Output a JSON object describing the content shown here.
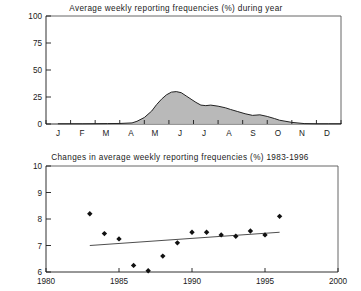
{
  "figure": {
    "width": 361,
    "height": 291,
    "background": "#ffffff",
    "ink_color": "#1a1a1a",
    "area_fill_color": "#b5b5b5",
    "area_line_color": "#222222",
    "marker_color": "#111111",
    "trend_color": "#3a3a3a"
  },
  "chart_data": [
    {
      "type": "area",
      "title": "Average weekly reporting frequencies (%) during year",
      "xlabel": "",
      "ylabel": "",
      "ylim": [
        0,
        100
      ],
      "yticks": [
        0,
        25,
        50,
        75,
        100
      ],
      "ytick_labels": [
        "0",
        "25",
        "50",
        "75",
        "100"
      ],
      "categories": [
        "J",
        "F",
        "M",
        "A",
        "M",
        "J",
        "J",
        "A",
        "S",
        "O",
        "N",
        "D"
      ],
      "xtick_labels": [
        "J",
        "F",
        "M",
        "A",
        "M",
        "J",
        "J",
        "A",
        "S",
        "O",
        "N",
        "D"
      ],
      "grid": false,
      "legend": "none",
      "x": [
        0.0,
        0.5,
        1.0,
        1.5,
        2.0,
        2.5,
        3.0,
        3.2,
        3.5,
        3.8,
        4.0,
        4.2,
        4.4,
        4.6,
        4.8,
        5.0,
        5.2,
        5.4,
        5.6,
        5.8,
        6.0,
        6.2,
        6.5,
        6.8,
        7.0,
        7.3,
        7.6,
        7.9,
        8.2,
        8.5,
        8.8,
        9.0,
        9.5,
        10.0,
        10.5,
        11.0,
        11.5
      ],
      "values": [
        0.2,
        0.2,
        0.2,
        0.3,
        0.4,
        0.5,
        1.0,
        2.5,
        6.0,
        12.0,
        18.0,
        23.0,
        27.0,
        29.5,
        30.0,
        29.0,
        26.0,
        23.0,
        20.0,
        17.5,
        17.0,
        17.5,
        16.5,
        15.0,
        13.5,
        11.5,
        9.5,
        8.0,
        8.5,
        7.0,
        5.0,
        3.5,
        1.5,
        0.4,
        0.2,
        0.2,
        0.2
      ],
      "notes": "Seasonal curve: flat near zero Jan-Mar, sharp rise through April, peak near 30% in early May, decline with a plateau near 17-18% in June-July, small secondary bump near 8% in mid-August, returning to zero by September and flat through December."
    },
    {
      "type": "scatter",
      "title": "Changes in average weekly reporting frequencies (%) 1983-1996",
      "xlabel": "",
      "ylabel": "",
      "xlim": [
        1980,
        2000
      ],
      "ylim": [
        6,
        10
      ],
      "xticks": [
        1980,
        1985,
        1990,
        1995,
        2000
      ],
      "xtick_labels": [
        "1980",
        "1985",
        "1990",
        "1995",
        "2000"
      ],
      "yticks": [
        6,
        7,
        8,
        9,
        10
      ],
      "ytick_labels": [
        "6",
        "7",
        "8",
        "9",
        "10"
      ],
      "grid": false,
      "legend": "none",
      "marker": "diamond",
      "x": [
        1983,
        1984,
        1985,
        1986,
        1987,
        1988,
        1989,
        1990,
        1991,
        1992,
        1993,
        1994,
        1995,
        1996
      ],
      "values": [
        8.2,
        7.45,
        7.25,
        6.25,
        6.05,
        6.6,
        7.1,
        7.5,
        7.5,
        7.4,
        7.35,
        7.55,
        7.4,
        8.1
      ],
      "trend": {
        "x": [
          1983,
          1996
        ],
        "y": [
          7.0,
          7.5
        ],
        "label": "linear trend"
      }
    }
  ]
}
